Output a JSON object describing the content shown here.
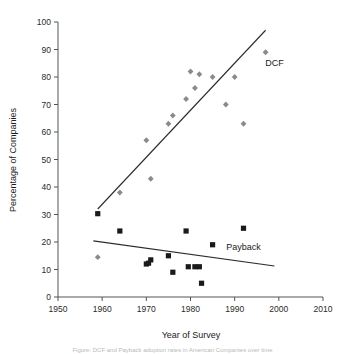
{
  "chart_data": {
    "type": "scatter",
    "title": "",
    "xlabel": "Year of Survey",
    "ylabel": "Percentage of Companies",
    "xlim": [
      1950,
      2010
    ],
    "ylim": [
      0,
      100
    ],
    "xticks": [
      1950,
      1960,
      1970,
      1980,
      1990,
      2000,
      2010
    ],
    "yticks": [
      0,
      10,
      20,
      30,
      40,
      50,
      60,
      70,
      80,
      90,
      100
    ],
    "grid": false,
    "legend_position": "inline-annotation",
    "series": [
      {
        "name": "DCF",
        "marker": "diamond",
        "color": "#8a8a8a",
        "label": "DCF",
        "label_x": 1999,
        "label_y": 84,
        "points": [
          {
            "x": 1959,
            "y": 14.5
          },
          {
            "x": 1964,
            "y": 38
          },
          {
            "x": 1970,
            "y": 57
          },
          {
            "x": 1971,
            "y": 43
          },
          {
            "x": 1975,
            "y": 63
          },
          {
            "x": 1976,
            "y": 66
          },
          {
            "x": 1979,
            "y": 72
          },
          {
            "x": 1980,
            "y": 82
          },
          {
            "x": 1981,
            "y": 76
          },
          {
            "x": 1982,
            "y": 81
          },
          {
            "x": 1985,
            "y": 80
          },
          {
            "x": 1988,
            "y": 70
          },
          {
            "x": 1990,
            "y": 80
          },
          {
            "x": 1992,
            "y": 63
          },
          {
            "x": 1997,
            "y": 89
          }
        ],
        "trend": {
          "x1": 1959,
          "y1": 32,
          "x2": 1997,
          "y2": 97
        }
      },
      {
        "name": "Payback",
        "marker": "square",
        "color": "#1a1a1a",
        "label": "Payback",
        "label_x": 1992,
        "label_y": 17,
        "points": [
          {
            "x": 1959,
            "y": 30.3
          },
          {
            "x": 1964,
            "y": 24
          },
          {
            "x": 1970,
            "y": 12
          },
          {
            "x": 1970.5,
            "y": 12.3
          },
          {
            "x": 1971,
            "y": 13.5
          },
          {
            "x": 1975,
            "y": 15
          },
          {
            "x": 1976,
            "y": 9
          },
          {
            "x": 1979,
            "y": 24
          },
          {
            "x": 1979.5,
            "y": 11
          },
          {
            "x": 1981,
            "y": 11
          },
          {
            "x": 1982,
            "y": 11
          },
          {
            "x": 1982.5,
            "y": 5
          },
          {
            "x": 1985,
            "y": 19
          },
          {
            "x": 1992,
            "y": 25
          }
        ],
        "trend": {
          "x1": 1958,
          "y1": 20.4,
          "x2": 1999,
          "y2": 11.3
        }
      }
    ]
  },
  "caption": {
    "text": "Figure: DCF and Payback adoption rates in American Companies over time"
  }
}
